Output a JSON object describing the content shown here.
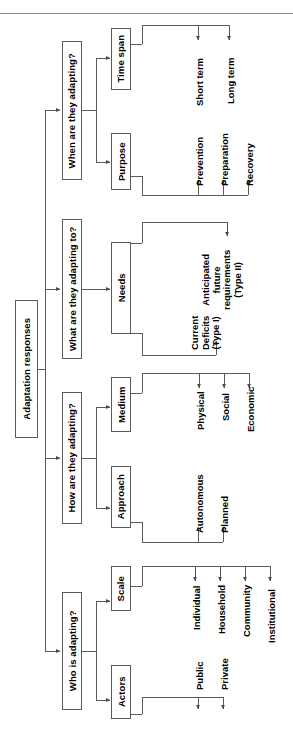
{
  "diagram": {
    "title": "Adaptation responses",
    "orientation": "rotated-90-ccw",
    "root": {
      "label": "Adaptation responses"
    },
    "branches": [
      {
        "question": "When are they adapting?",
        "categories": [
          {
            "label": "Purpose",
            "leaves": [
              "Prevention",
              "Preparation",
              "Recovery"
            ]
          },
          {
            "label": "Time span",
            "leaves": [
              "Short term",
              "Long term"
            ]
          }
        ]
      },
      {
        "question": "What are they adapting to?",
        "categories": [
          {
            "label": "Needs",
            "leaves": [
              "Current\nDeficits\n(Type I)",
              "Anticipated\nfuture\nrequirements\n(Type II)"
            ]
          }
        ]
      },
      {
        "question": "How are they adapting?",
        "categories": [
          {
            "label": "Approach",
            "leaves": [
              "Autonomous",
              "Planned"
            ]
          },
          {
            "label": "Medium",
            "leaves": [
              "Physical",
              "Social",
              "Economic"
            ]
          }
        ]
      },
      {
        "question": "Who is adapting?",
        "categories": [
          {
            "label": "Actors",
            "leaves": [
              "Public",
              "Private"
            ]
          },
          {
            "label": "Scale",
            "leaves": [
              "Individual",
              "Household",
              "Community",
              "Institutional"
            ]
          }
        ]
      }
    ],
    "colors": {
      "line": "#5b5b5b",
      "rule": "#8a8a8a",
      "text": "#000000",
      "background": "#ffffff"
    }
  }
}
